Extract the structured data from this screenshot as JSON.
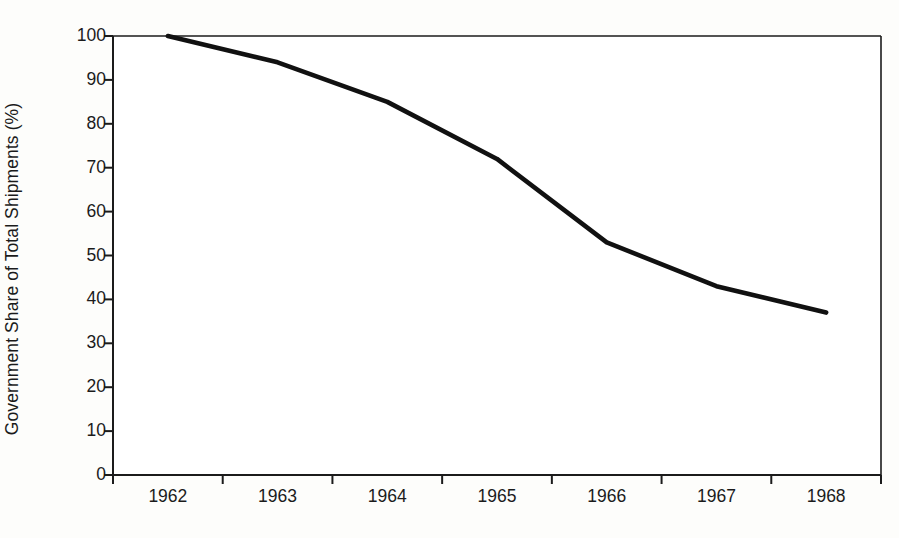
{
  "chart_data": {
    "type": "line",
    "title": "",
    "xlabel": "",
    "ylabel": "Government Share of Total Shipments (%)",
    "categories": [
      "1962",
      "1963",
      "1964",
      "1965",
      "1966",
      "1967",
      "1968"
    ],
    "values": [
      100,
      94,
      85,
      72,
      53,
      43,
      37
    ],
    "series": [
      {
        "name": "Government Share of Total Shipments (%)",
        "values": [
          100,
          94,
          85,
          72,
          53,
          43,
          37
        ]
      }
    ],
    "ylim": [
      0,
      100
    ],
    "y_ticks": [
      0,
      10,
      20,
      30,
      40,
      50,
      60,
      70,
      80,
      90,
      100
    ],
    "y_tick_labels": [
      "0",
      "10",
      "20",
      "30",
      "40",
      "50",
      "60",
      "70",
      "80",
      "90",
      "100"
    ],
    "x_tick_labels": [
      "1962",
      "1963",
      "1964",
      "1965",
      "1966",
      "1967",
      "1968"
    ],
    "grid": false,
    "legend": false,
    "legend_position": "none",
    "line_color": "#111111",
    "plot_background": "#ffffff",
    "figure_background": "#fdfdfb",
    "axis_color": "#1b1b1b"
  }
}
